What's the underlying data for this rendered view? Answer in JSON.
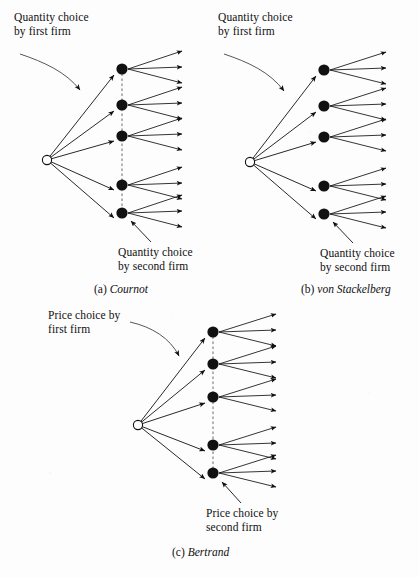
{
  "figure": {
    "background_color": "#fdfdfd",
    "ink_color": "#111111",
    "dotted_line_color": "#9a9a9a"
  },
  "panels": [
    {
      "id": "cournot",
      "caption_letter": "(a)",
      "caption_name": "Cournot",
      "first_mover_label_line1": "Quantity choice",
      "first_mover_label_line2": "by first firm",
      "second_mover_label_line1": "Quantity choice",
      "second_mover_label_line2": "by second firm",
      "information_set": "dotted",
      "root_node_style": "hollow",
      "first_branches": 5,
      "second_branches_per_node": 3,
      "simultaneous": "yes"
    },
    {
      "id": "von-stackelberg",
      "caption_letter": "(b)",
      "caption_name": "von Stackelberg",
      "first_mover_label_line1": "Quantity choice",
      "first_mover_label_line2": "by first firm",
      "second_mover_label_line1": "Quantity choice",
      "second_mover_label_line2": "by second firm",
      "information_set": "none",
      "root_node_style": "hollow",
      "first_branches": 5,
      "second_branches_per_node": 3,
      "simultaneous": "no"
    },
    {
      "id": "bertrand",
      "caption_letter": "(c)",
      "caption_name": "Bertrand",
      "first_mover_label_line1": "Price choice by",
      "first_mover_label_line2": "first firm",
      "second_mover_label_line1": "Price choice by",
      "second_mover_label_line2": "second firm",
      "information_set": "dotted",
      "root_node_style": "hollow",
      "first_branches": 5,
      "second_branches_per_node": 3,
      "simultaneous": "yes"
    }
  ],
  "geometry": {
    "node_offsets_y": [
      -69,
      -33,
      -2,
      47,
      75
    ],
    "leaf_offsets_y": [
      -18,
      -2,
      14
    ],
    "node_radius": 5.6,
    "root_radius": 4.6,
    "branch_span_x": 75,
    "leaf_span_x": 60
  }
}
